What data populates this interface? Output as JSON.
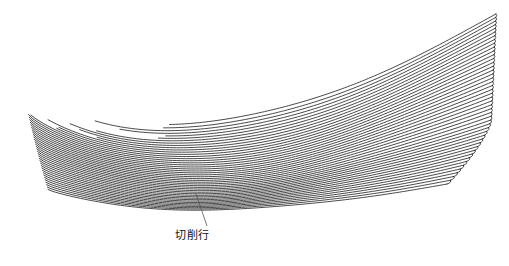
{
  "figure": {
    "kind": "cam-toolpath-surface-diagram",
    "background_color": "#ffffff",
    "line_color": "#1a1a1a",
    "line_width": 0.8,
    "leader_color": "#555555",
    "canvas": {
      "width": 509,
      "height": 266
    }
  },
  "annotations": [
    {
      "id": "cutting-rows",
      "label": "切削行",
      "label_x": 175,
      "label_y": 230,
      "leader_from_x": 196,
      "leader_from_y": 194,
      "leader_to_x": 207,
      "leader_to_y": 226
    }
  ],
  "chart_data": {
    "type": "line",
    "title": "",
    "subtitle": "",
    "xlabel": "",
    "ylabel": "",
    "legend": [],
    "grid": false,
    "xlim": [
      0,
      509
    ],
    "ylim": [
      0,
      266
    ],
    "pass_count": 46,
    "series": [
      {
        "name": "cutting-pass-band",
        "left_tip": {
          "x": 16,
          "y": 72
        },
        "right_top": {
          "x": 496,
          "y": 13
        },
        "right_bottom": {
          "x": 452,
          "y": 184
        },
        "bottom_low": {
          "x": 300,
          "y": 190
        }
      }
    ]
  }
}
